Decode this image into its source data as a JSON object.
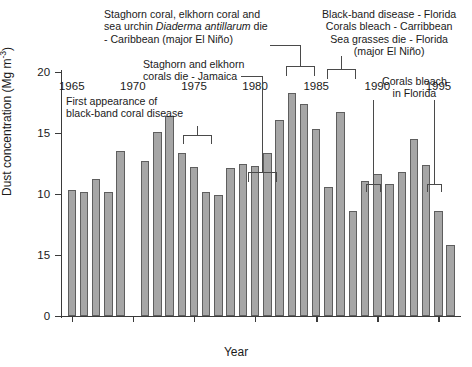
{
  "chart_data": {
    "type": "bar",
    "title": "",
    "xlabel": "Year",
    "ylabel": "Dust concentration (Mg m-3)",
    "ylabel_parts": {
      "text": "Dust concentration (Mg m",
      "sup": "-3",
      "tail": ")"
    },
    "xlim": [
      1964.2,
      1996.6
    ],
    "ylim": [
      0,
      20
    ],
    "grid": false,
    "legend": null,
    "bar_color": "#a6a6a6",
    "bar_edge_color": "#5e5e5e",
    "ytick_labels": [
      "0",
      "15",
      "10",
      "15",
      "20"
    ],
    "ytick_values": [
      0,
      5,
      10,
      15,
      20
    ],
    "xtick_labels": [
      "1965",
      "1970",
      "1975",
      "1980",
      "1985",
      "1990",
      "1995"
    ],
    "xtick_values": [
      1965,
      1970,
      1975,
      1980,
      1985,
      1990,
      1995
    ],
    "categories": [
      1965,
      1966,
      1967,
      1968,
      1969,
      1971,
      1972,
      1973,
      1974,
      1975,
      1976,
      1977,
      1978,
      1979,
      1980,
      1981,
      1982,
      1983,
      1984,
      1985,
      1986,
      1987,
      1988,
      1989,
      1990,
      1991,
      1992,
      1993,
      1994,
      1995,
      1996
    ],
    "values": [
      10.3,
      10.2,
      11.2,
      10.2,
      13.5,
      12.7,
      15.1,
      16.4,
      13.4,
      12.2,
      10.2,
      9.9,
      12.1,
      12.5,
      12.3,
      13.4,
      16.1,
      18.3,
      17.4,
      15.3,
      10.6,
      16.7,
      8.6,
      11.1,
      11.6,
      10.8,
      11.8,
      14.5,
      12.4,
      8.6,
      5.8
    ]
  },
  "annotations": {
    "first_appearance": {
      "line1": "First appearance of",
      "line2": "black-band coral disease"
    },
    "staghorn_caribbean": {
      "line1": "Staghorn coral, elkhorn coral and",
      "line2_pre": "sea urchin ",
      "line2_italic": "Diaderma antillarum",
      "line2_post": " die",
      "line3": "- Caribbean (major El Niño)"
    },
    "staghorn_jamaica": {
      "line1": "Staghorn and elkhorn",
      "line2": "corals die - Jamaica"
    },
    "blackband_florida": {
      "line1": "Black-band disease - Florida",
      "line2": "Corals bleach - Carribbean",
      "line3": "Sea grasses die - Florida",
      "line4": "(major El Niño)"
    },
    "corals_bleach_florida": {
      "line1": "Corals bleach",
      "line2": "in Florida"
    }
  }
}
